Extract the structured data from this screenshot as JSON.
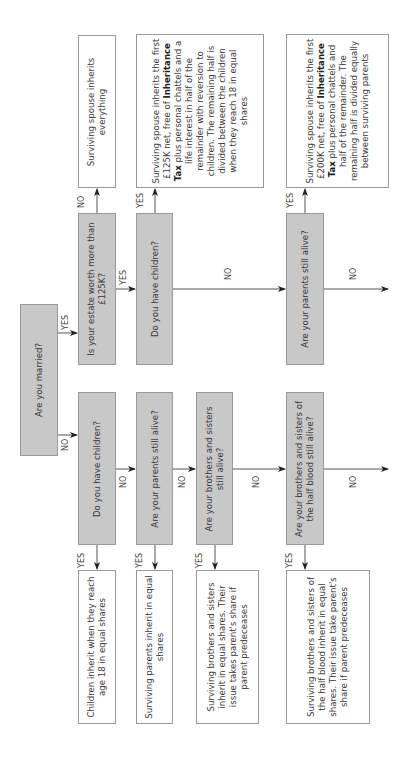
{
  "flowchart": {
    "orientation": "rotated 90 degrees counter-clockwise",
    "colors": {
      "question_fill": "#c8c8c8",
      "result_fill": "#ffffff",
      "line": "#555555"
    },
    "start": {
      "id": "married",
      "text": "Are you married?"
    },
    "questions": {
      "estate": "Is your estate worth more than £125K?",
      "married_children": "Do you have children?",
      "married_parents": "Are your parents still alive?",
      "single_children": "Do you have children?",
      "single_parents": "Are your parents still alive?",
      "siblings": "Are your brothers and sisters still alive?",
      "half_blood": "Are your brothers and sisters of the half blood still alive?"
    },
    "results": {
      "spouse_all": "Surviving spouse inherits everything",
      "spouse_children_pre": "Surviving spouse inherits the first £125K net, free of ",
      "spouse_children_bold": "Inheritance Tax",
      "spouse_children_post": " plus personal chattels and a life interest in half of the remainder with reversion to children. The remaining half is divided between the children when they reach 18 in equal shares",
      "spouse_parents_pre": "Surviving spouse inherits the first £200K net, free of ",
      "spouse_parents_bold": "Inheritance Tax",
      "spouse_parents_post": " plus personal chattels and half of the remainder. The remaining half is divided equally between surviving parents",
      "children": "Children inherit when they reach age 18 in equal shares",
      "parents": "Surviving parents inherit in equal shares",
      "siblings": "Surviving brothers and sisters inherit in equal shares. Their issue takes parent's share if parent predeceases",
      "half_blood": "Surviving brothers and sisters of the half blood inherit in equal shares. Their issue take parent's share if parent predeceases"
    },
    "edge_labels": {
      "yes": "YES",
      "no": "NO"
    }
  }
}
